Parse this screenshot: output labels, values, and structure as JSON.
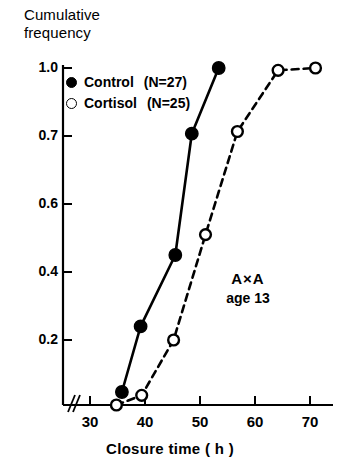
{
  "chart_data": {
    "type": "line",
    "title": "",
    "ylabel_line1": "Cumulative",
    "ylabel_line2": "frequency",
    "xlabel": "Closure time ( h )",
    "xlim": [
      28,
      74
    ],
    "ylim": [
      0,
      1.0
    ],
    "grid": false,
    "x_ticks": [
      30,
      40,
      50,
      60,
      70
    ],
    "x_tick_labels": [
      "30",
      "40",
      "50",
      "60",
      "70"
    ],
    "y_ticks": [
      0.2,
      0.4,
      0.6,
      0.7,
      1.0
    ],
    "y_tick_labels": [
      "0.2",
      "0.4",
      "0.6",
      "0.7",
      "1.0"
    ],
    "axis_break": "//",
    "legend_position": "top-left",
    "series": [
      {
        "name": "Control",
        "n_label": "(N=27)",
        "n": 27,
        "marker": "filled-circle",
        "line_style": "solid",
        "color": "#000000",
        "points": [
          {
            "x": 35.8,
            "y": 0.04
          },
          {
            "x": 39.2,
            "y": 0.24
          },
          {
            "x": 45.5,
            "y": 0.45
          },
          {
            "x": 48.5,
            "y": 0.71
          },
          {
            "x": 53.4,
            "y": 1.0
          }
        ]
      },
      {
        "name": "Cortisol",
        "n_label": "(N=25)",
        "n": 25,
        "marker": "open-circle",
        "line_style": "dashed",
        "color": "#000000",
        "points": [
          {
            "x": 34.8,
            "y": 0.0
          },
          {
            "x": 39.4,
            "y": 0.03
          },
          {
            "x": 45.2,
            "y": 0.2
          },
          {
            "x": 51.0,
            "y": 0.51
          },
          {
            "x": 56.8,
            "y": 0.72
          },
          {
            "x": 64.2,
            "y": 0.99
          },
          {
            "x": 71.0,
            "y": 1.0
          }
        ]
      }
    ],
    "annotation_line1": "A×A",
    "annotation_line2": "age 13"
  }
}
